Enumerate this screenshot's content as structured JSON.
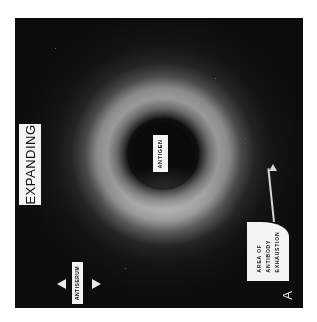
{
  "figure": {
    "panel_letter": "A",
    "title_label": "EXPANDING",
    "center_well_label": "ANTIGEN",
    "outer_well_label": "ANTISERUM",
    "callout": {
      "lines": [
        "AREA OF",
        "ANTIBODY",
        "EXHAUSTION"
      ]
    },
    "colors": {
      "background": "#0d0d0d",
      "precipitin_ring": "#9a9a9a",
      "label_fill": "#f4f4f4",
      "label_text": "#111111"
    }
  }
}
